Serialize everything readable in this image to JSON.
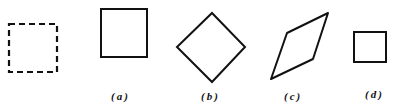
{
  "figure": {
    "stroke_color": "#111111",
    "background": "#ffffff",
    "original": {
      "name": "original-dashed-square",
      "style": "dashed"
    },
    "variants": [
      {
        "id": "a",
        "label": "(a)",
        "shape": "square"
      },
      {
        "id": "b",
        "label": "(b)",
        "shape": "diamond (rotated square)"
      },
      {
        "id": "c",
        "label": "(c)",
        "shape": "parallelogram (sheared square)"
      },
      {
        "id": "d",
        "label": "(d)",
        "shape": "small square (scaled)"
      }
    ]
  }
}
